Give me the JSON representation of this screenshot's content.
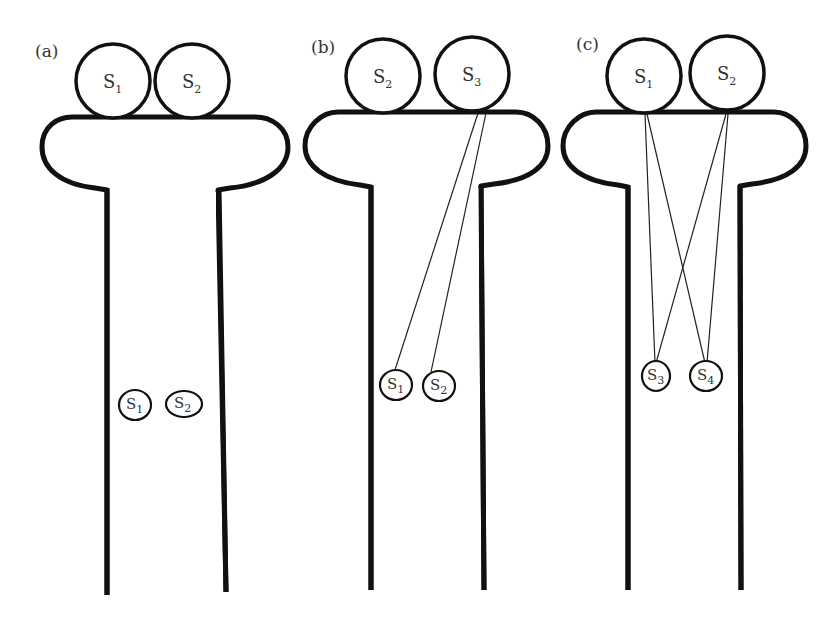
{
  "figure": {
    "panels": [
      {
        "id": "a",
        "label": "(a)",
        "surface": [
          {
            "base": "S",
            "sub": "1"
          },
          {
            "base": "S",
            "sub": "2"
          }
        ],
        "internal": [
          {
            "base": "S",
            "sub": "1"
          },
          {
            "base": "S",
            "sub": "2"
          }
        ],
        "tethers": []
      },
      {
        "id": "b",
        "label": "(b)",
        "surface": [
          {
            "base": "S",
            "sub": "2"
          },
          {
            "base": "S",
            "sub": "3"
          }
        ],
        "internal": [
          {
            "base": "S",
            "sub": "1"
          },
          {
            "base": "S",
            "sub": "2"
          }
        ],
        "tethers": [
          {
            "from": "S3",
            "to": "S1"
          },
          {
            "from": "S3",
            "to": "S2"
          }
        ]
      },
      {
        "id": "c",
        "label": "(c)",
        "surface": [
          {
            "base": "S",
            "sub": "1"
          },
          {
            "base": "S",
            "sub": "2"
          }
        ],
        "internal": [
          {
            "base": "S",
            "sub": "3"
          },
          {
            "base": "S",
            "sub": "4"
          }
        ],
        "tethers": [
          {
            "from": "S1",
            "to": "S3"
          },
          {
            "from": "S1",
            "to": "S4"
          },
          {
            "from": "S2",
            "to": "S3"
          },
          {
            "from": "S2",
            "to": "S4"
          }
        ]
      }
    ],
    "colors": {
      "stroke": "#111111",
      "text": "#333333",
      "background": "#ffffff"
    }
  }
}
